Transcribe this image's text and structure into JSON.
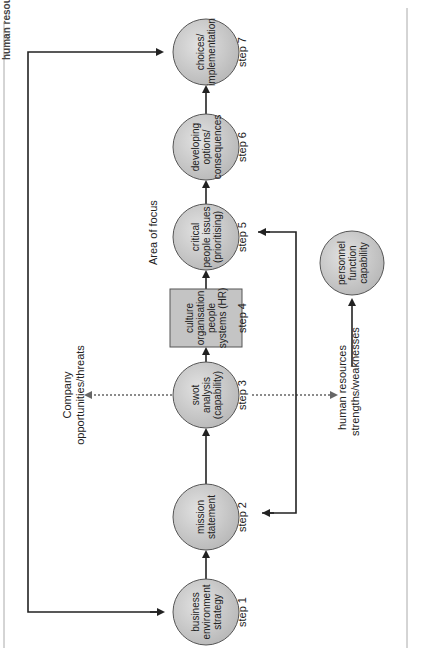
{
  "title": "human resources strategy",
  "nodes": [
    {
      "id": "step1",
      "shape": "circle",
      "lines": [
        "business",
        "environment",
        "strategy"
      ],
      "step_label": "step 1"
    },
    {
      "id": "step2",
      "shape": "circle",
      "lines": [
        "mission",
        "statement"
      ],
      "step_label": "step 2"
    },
    {
      "id": "step3",
      "shape": "circle",
      "lines": [
        "swot",
        "analysis",
        "(capability)"
      ],
      "step_label": "step 3"
    },
    {
      "id": "step4",
      "shape": "box",
      "lines": [
        "culture",
        "organisation",
        "people",
        "systems (HR)"
      ],
      "step_label": "step 4"
    },
    {
      "id": "step5",
      "shape": "circle",
      "lines": [
        "critical",
        "people issues",
        "(prioritising)"
      ],
      "step_label": "step 5"
    },
    {
      "id": "step6",
      "shape": "circle",
      "lines": [
        "developing",
        "options/",
        "consequences"
      ],
      "step_label": "step 6"
    },
    {
      "id": "step7",
      "shape": "circle",
      "lines": [
        "choices/",
        "implementation"
      ],
      "step_label": "step 7"
    }
  ],
  "side_node": {
    "id": "personnel",
    "shape": "circle",
    "lines": [
      "personnel",
      "function",
      "capability"
    ]
  },
  "labels": {
    "area_of_focus": "Area of focus",
    "company": [
      "Company",
      "opportunities/threats"
    ],
    "human_resources": [
      "human resources",
      "strengths/weaknesses"
    ]
  },
  "colors": {
    "node_fill": "#c8c8c8",
    "node_stroke": "#555555",
    "arrow": "#222222",
    "border": "#999999"
  }
}
